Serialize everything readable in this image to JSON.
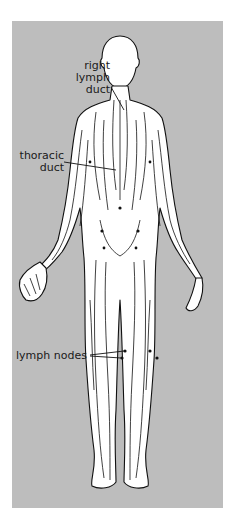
{
  "diagram": {
    "labels": {
      "right_lymph_duct": [
        "right",
        "lymph",
        "duct"
      ],
      "thoracic_duct": [
        "thoracic",
        "duct"
      ],
      "lymph_nodes": "lymph nodes"
    },
    "colors": {
      "panel_background": "#bdbdbd",
      "body_fill": "#ffffff",
      "vessel_stroke": "#111111"
    }
  }
}
